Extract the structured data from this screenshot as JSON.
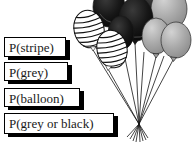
{
  "labels": [
    {
      "text": "P(stripe)"
    },
    {
      "text": "P(grey)"
    },
    {
      "text": "P(balloon)"
    },
    {
      "text": "P(grey or black)"
    }
  ],
  "illustration": {
    "name": "balloon-bunch",
    "balloon_types": [
      "striped",
      "black",
      "grey"
    ],
    "counts": {
      "striped": 2,
      "black": 3,
      "grey": 3
    },
    "strings": "tied together at a single knot with tassel"
  },
  "colors": {
    "background": "#ffffff",
    "label_box_bg": "#ffffff",
    "label_box_border": "#000000",
    "label_box_shadow": "#000000",
    "text": "#1a1a1a",
    "balloon_black": "#141414",
    "balloon_grey": "#a9a9a9",
    "balloon_stripe_bg": "#ffffff",
    "outline": "#1a1a1a",
    "string": "#151515"
  }
}
